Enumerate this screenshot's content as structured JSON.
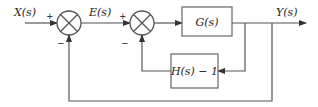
{
  "diagram": {
    "type": "control-system-block-diagram",
    "signals": {
      "input": "X(s)",
      "error": "E(s)",
      "output": "Y(s)"
    },
    "summing_junctions": [
      {
        "id": "sum1",
        "signs": {
          "left": "+",
          "bottom": "−"
        }
      },
      {
        "id": "sum2",
        "signs": {
          "left": "+",
          "bottom": "−"
        }
      }
    ],
    "blocks": [
      {
        "id": "forward",
        "label": "G(s)"
      },
      {
        "id": "feedback-inner",
        "label": "H(s) − 1"
      }
    ],
    "connections": [
      {
        "from": "X(s)",
        "to": "sum1",
        "sign": "+"
      },
      {
        "from": "sum1",
        "to": "sum2",
        "label": "E(s)",
        "sign": "+"
      },
      {
        "from": "sum2",
        "to": "forward"
      },
      {
        "from": "forward",
        "to": "Y(s)"
      },
      {
        "from": "Y(s)",
        "to": "feedback-inner"
      },
      {
        "from": "feedback-inner",
        "to": "sum2",
        "sign": "−"
      },
      {
        "from": "Y(s)",
        "to": "sum1",
        "sign": "−",
        "note": "unity outer feedback"
      }
    ]
  },
  "colors": {
    "line": "#555555",
    "text": "#222222",
    "background": "#ffffff"
  }
}
